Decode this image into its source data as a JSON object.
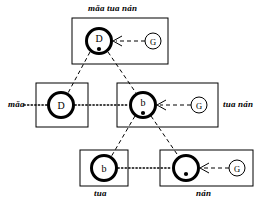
{
  "figure": {
    "type": "linguistic-lattice-diagram",
    "width": 273,
    "height": 218,
    "background_color": "#ffffff",
    "line_color": "#000000"
  },
  "labels": {
    "top": "mǎa tua nán",
    "left": "mǎa",
    "right": "tua nán",
    "bottom_left": "tua",
    "bottom_right": "nán"
  },
  "boxes": [
    {
      "id": "box-top",
      "label": "mǎa tua nán",
      "label_position": "above",
      "x": 72,
      "y": 18,
      "width": 96,
      "height": 46
    },
    {
      "id": "box-middle-left",
      "label": "mǎa",
      "label_position": "left",
      "x": 36,
      "y": 83,
      "width": 52,
      "height": 44
    },
    {
      "id": "box-middle-center",
      "label": "tua nán",
      "label_position": "right",
      "x": 117,
      "y": 83,
      "width": 101,
      "height": 44
    },
    {
      "id": "box-bottom-left",
      "label": "tua",
      "label_position": "below",
      "x": 80,
      "y": 150,
      "width": 48,
      "height": 36
    },
    {
      "id": "box-bottom-right",
      "label": "nán",
      "label_position": "below",
      "x": 160,
      "y": 150,
      "width": 93,
      "height": 36
    }
  ],
  "nodes": [
    {
      "id": "node-top",
      "letter": "D",
      "has_dot": true,
      "cx": 99,
      "cy": 41,
      "r": 13
    },
    {
      "id": "node-middle-left",
      "letter": "D",
      "has_dot": false,
      "cx": 61,
      "cy": 105,
      "r": 13
    },
    {
      "id": "node-middle-center",
      "letter": "b",
      "has_dot": true,
      "cx": 143,
      "cy": 105,
      "r": 13
    },
    {
      "id": "node-bottom-left",
      "letter": "b",
      "has_dot": false,
      "cx": 104,
      "cy": 168,
      "r": 13
    },
    {
      "id": "node-bottom-right",
      "letter": "",
      "has_dot": true,
      "cx": 186,
      "cy": 168,
      "r": 13
    }
  ],
  "g_sources": [
    {
      "id": "g-top",
      "letter": "G",
      "cx": 153,
      "cy": 41,
      "r": 8,
      "arrow_to_x": 113,
      "arrow_to_y": 41
    },
    {
      "id": "g-middle",
      "letter": "G",
      "cx": 199,
      "cy": 105,
      "r": 8,
      "arrow_to_x": 157,
      "arrow_to_y": 105
    },
    {
      "id": "g-bottom",
      "letter": "G",
      "cx": 237,
      "cy": 168,
      "r": 8,
      "arrow_to_x": 200,
      "arrow_to_y": 168
    }
  ],
  "tree_edges": [
    {
      "from": "node-top",
      "to": "node-middle-left",
      "style": "dashed"
    },
    {
      "from": "node-top",
      "to": "node-middle-center",
      "style": "dashed"
    },
    {
      "from": "node-middle-center",
      "to": "node-bottom-left",
      "style": "dashed"
    },
    {
      "from": "node-middle-center",
      "to": "node-bottom-right",
      "style": "dashed"
    }
  ],
  "link_edges": [
    {
      "from": "node-middle-left",
      "to": "node-middle-center",
      "style": "dotted"
    },
    {
      "from": "node-bottom-left",
      "to": "node-bottom-right",
      "style": "dotted"
    }
  ]
}
